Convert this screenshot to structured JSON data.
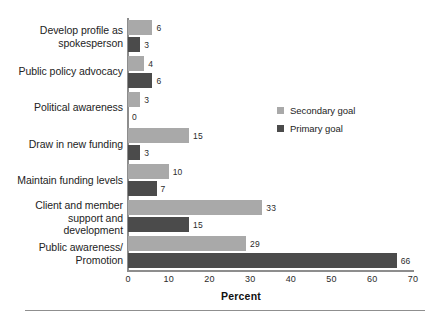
{
  "chart_data": {
    "type": "bar",
    "orientation": "horizontal",
    "title": "",
    "xlabel": "Percent",
    "ylabel": "",
    "xlim": [
      0,
      70
    ],
    "xticks": [
      "0",
      "10",
      "20",
      "30",
      "40",
      "50",
      "60",
      "70"
    ],
    "grid": false,
    "legend_position": "center-right",
    "categories": [
      "Develop profile as spokesperson",
      "Public policy advocacy",
      "Political awareness",
      "Draw in new funding",
      "Maintain funding levels",
      "Client and member support and development",
      "Public awareness/ Promotion"
    ],
    "category_lines": [
      [
        "Develop profile as",
        "spokesperson"
      ],
      [
        "Public policy advocacy"
      ],
      [
        "Political awareness"
      ],
      [
        "Draw in new funding"
      ],
      [
        "Maintain funding levels"
      ],
      [
        "Client and member",
        "support and",
        "development"
      ],
      [
        "Public awareness/",
        "Promotion"
      ]
    ],
    "series": [
      {
        "name": "Secondary goal",
        "color": "#a9a9a9",
        "values": [
          6,
          4,
          3,
          15,
          10,
          33,
          29
        ],
        "labels": [
          "6",
          "4",
          "3",
          "15",
          "10",
          "33",
          "29"
        ]
      },
      {
        "name": "Primary goal",
        "color": "#4b4b4b",
        "values": [
          3,
          6,
          0,
          3,
          7,
          15,
          66
        ],
        "labels": [
          "3",
          "6",
          "0",
          "3",
          "7",
          "15",
          "66"
        ]
      }
    ]
  },
  "legend": {
    "items": [
      {
        "label": "Secondary goal",
        "color": "#a9a9a9"
      },
      {
        "label": "Primary goal",
        "color": "#4b4b4b"
      }
    ]
  },
  "axis": {
    "x_title": "Percent",
    "ticks": [
      "0",
      "10",
      "20",
      "30",
      "40",
      "50",
      "60",
      "70"
    ]
  },
  "colors": {
    "secondary": "#a9a9a9",
    "primary": "#4b4b4b",
    "axis": "#8d8d8d",
    "text": "#232323",
    "background": "#ffffff"
  }
}
